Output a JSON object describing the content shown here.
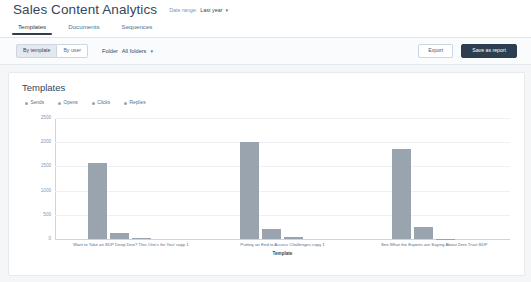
{
  "header": {
    "title": "Sales Content Analytics",
    "date_range_label": "Date range:",
    "date_range_value": "Last year",
    "caret": "▾"
  },
  "tabs": [
    {
      "label": "Templates",
      "active": true
    },
    {
      "label": "Documents",
      "active": false
    },
    {
      "label": "Sequences",
      "active": false
    }
  ],
  "toolbar": {
    "segments": [
      {
        "label": "By template",
        "selected": true
      },
      {
        "label": "By user",
        "selected": false
      }
    ],
    "folder_label": "Folder",
    "folder_value": "All folders",
    "folder_caret": "▾",
    "export_label": "Export",
    "save_label": "Save as report"
  },
  "card": {
    "title": "Templates"
  },
  "colors": {
    "bar": "#99a4ae",
    "legend_sends": "#99a4ae",
    "legend_opens": "#99a4ae",
    "legend_clicks": "#99a4ae",
    "legend_replies": "#99a4ae",
    "accent_dark": "#2d3e50",
    "grid": "#eef0f3",
    "axis": "#cdd4dd",
    "card_bg": "#ffffff",
    "page_bg": "#f5f6f7"
  },
  "chart_data": {
    "type": "bar",
    "title": "Templates",
    "xlabel": "Template",
    "ylabel": "",
    "ylim": [
      0,
      2500
    ],
    "yticks": [
      0,
      500,
      1000,
      1500,
      2000,
      2500
    ],
    "ytick_labels": [
      "0",
      "500",
      "1000",
      "1500",
      "2000",
      "2500"
    ],
    "grid": true,
    "legend_position": "top-left",
    "categories": [
      "Want to Take an SDP Deep Dive? This One's for You! copy 1",
      "Putting an End to Access Challenges copy 1",
      "See What the Experts are Saying About Zero Trust SDP"
    ],
    "series": [
      {
        "name": "Sends",
        "values": [
          1570,
          2010,
          1850
        ]
      },
      {
        "name": "Opens",
        "values": [
          130,
          200,
          250
        ]
      },
      {
        "name": "Clicks",
        "values": [
          25,
          40,
          10
        ]
      },
      {
        "name": "Replies",
        "values": [
          0,
          0,
          0
        ]
      }
    ]
  }
}
